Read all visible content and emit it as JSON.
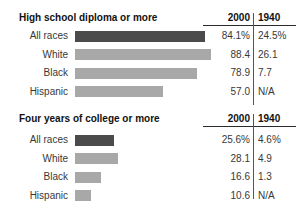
{
  "colors": {
    "bar_highlight": "#4b4b4b",
    "bar_default": "#a8a8a8",
    "header_text": "#111111",
    "body_text": "#383838",
    "rule": "#2b2b2b",
    "divider": "#555555"
  },
  "chart_data": [
    {
      "type": "bar",
      "orientation": "horizontal",
      "title": "High school diploma or more",
      "columns": [
        "2000",
        "1940"
      ],
      "categories": [
        "All races",
        "White",
        "Black",
        "Hispanic"
      ],
      "series": [
        {
          "name": "2000",
          "values": [
            84.1,
            88.4,
            78.9,
            57.0
          ],
          "labels": [
            "84.1%",
            "88.4",
            "78.9",
            "57.0"
          ]
        },
        {
          "name": "1940",
          "values": [
            24.5,
            26.1,
            7.7,
            null
          ],
          "labels": [
            "24.5%",
            "26.1",
            "7.7",
            "N/A"
          ]
        }
      ],
      "bars_show_series": "2000",
      "highlighted_category": "All races",
      "xlim": [
        0,
        100
      ],
      "grid": false,
      "legend": false
    },
    {
      "type": "bar",
      "orientation": "horizontal",
      "title": "Four years of college or more",
      "columns": [
        "2000",
        "1940"
      ],
      "categories": [
        "All races",
        "White",
        "Black",
        "Hispanic"
      ],
      "series": [
        {
          "name": "2000",
          "values": [
            25.6,
            28.1,
            16.6,
            10.6
          ],
          "labels": [
            "25.6%",
            "28.1",
            "16.6",
            "10.6"
          ]
        },
        {
          "name": "1940",
          "values": [
            4.6,
            4.9,
            1.3,
            null
          ],
          "labels": [
            "4.6%",
            "4.9",
            "1.3",
            "N/A"
          ]
        }
      ],
      "bars_show_series": "2000",
      "highlighted_category": "All races",
      "xlim": [
        0,
        100
      ],
      "grid": false,
      "legend": false
    }
  ]
}
